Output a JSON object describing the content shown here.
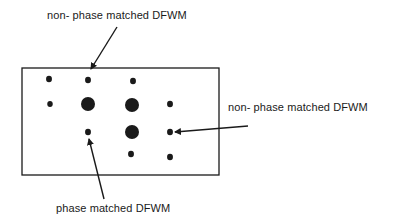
{
  "diagram": {
    "type": "diffraction-spot-pattern",
    "colors": {
      "ink": "#1a1a1a",
      "background": "#ffffff"
    },
    "frame": {
      "x": 22,
      "y": 68,
      "width": 197,
      "height": 107
    },
    "spots": [
      {
        "x": 49,
        "y": 79,
        "r": 3.2,
        "size": "small"
      },
      {
        "x": 88,
        "y": 80,
        "r": 3.2,
        "size": "small"
      },
      {
        "x": 133,
        "y": 81,
        "r": 3.2,
        "size": "small"
      },
      {
        "x": 50,
        "y": 104,
        "r": 3.0,
        "size": "small"
      },
      {
        "x": 88,
        "y": 104,
        "r": 7.0,
        "size": "large"
      },
      {
        "x": 132,
        "y": 105,
        "r": 7.0,
        "size": "large"
      },
      {
        "x": 170,
        "y": 104,
        "r": 3.2,
        "size": "small"
      },
      {
        "x": 88,
        "y": 132,
        "r": 3.2,
        "size": "small"
      },
      {
        "x": 132,
        "y": 132,
        "r": 7.0,
        "size": "large"
      },
      {
        "x": 170,
        "y": 132,
        "r": 3.2,
        "size": "small"
      },
      {
        "x": 131,
        "y": 154,
        "r": 3.2,
        "size": "small"
      },
      {
        "x": 170,
        "y": 157,
        "r": 3.2,
        "size": "small"
      }
    ],
    "annotations": [
      {
        "id": "top",
        "text": "non- phase matched DFWM",
        "label_x": 47,
        "label_y": 9,
        "arrow": {
          "x1": 117,
          "y1": 27,
          "x2": 91,
          "y2": 69
        }
      },
      {
        "id": "right",
        "text": "non- phase matched DFWM",
        "label_x": 228,
        "label_y": 101,
        "arrow": {
          "x1": 248,
          "y1": 126,
          "x2": 175,
          "y2": 132
        }
      },
      {
        "id": "bottom",
        "text": "phase matched DFWM",
        "label_x": 56,
        "label_y": 202,
        "arrow": {
          "x1": 104,
          "y1": 199,
          "x2": 89,
          "y2": 139
        }
      }
    ]
  }
}
